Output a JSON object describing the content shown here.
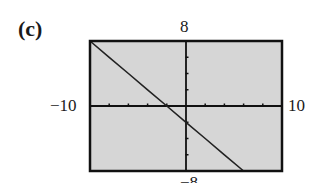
{
  "panel": {
    "label": "(c)"
  },
  "window_labels": {
    "xmin": "−10",
    "xmax": "10",
    "ymax": "8",
    "ymin": "−8"
  },
  "colors": {
    "screen_bg": "#d6d6d6",
    "frame": "#111111",
    "axis": "#111111",
    "line": "#222222"
  },
  "chart_data": {
    "type": "line",
    "title": "(c)",
    "xlabel": "",
    "ylabel": "",
    "xlim": [
      -10,
      10
    ],
    "ylim": [
      -8,
      8
    ],
    "xscale_tick": 2,
    "yscale_tick": 2,
    "grid": false,
    "legend": null,
    "series": [
      {
        "name": "y = -x - 2",
        "x": [
          -10,
          -8,
          -6,
          -4,
          -2,
          0,
          2,
          4,
          6
        ],
        "y": [
          8,
          6,
          4,
          2,
          0,
          -2,
          -4,
          -6,
          -8
        ]
      }
    ],
    "annotations": {
      "window_edge_labels": {
        "left": "-10",
        "right": "10",
        "top": "8",
        "bottom": "-8"
      }
    }
  }
}
